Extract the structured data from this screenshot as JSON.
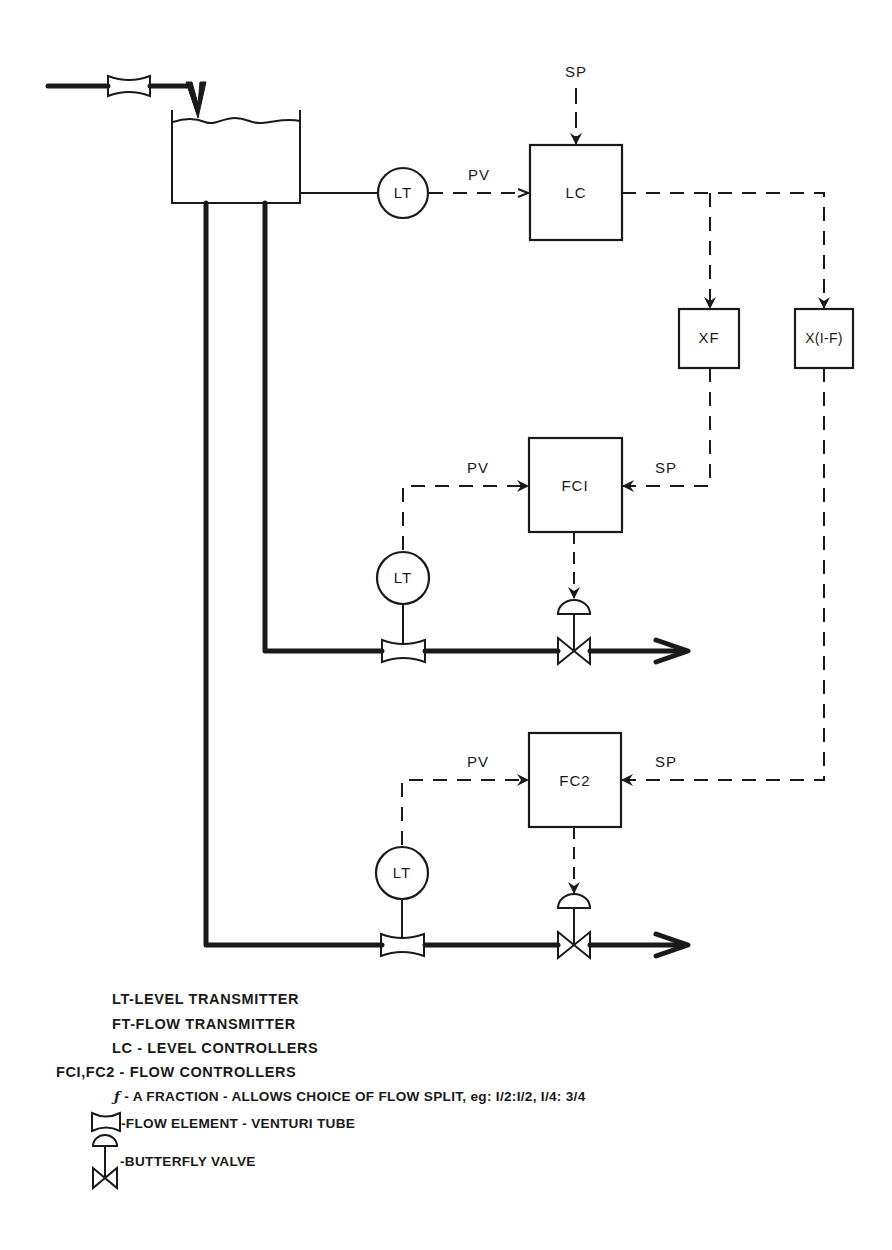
{
  "diagram": {
    "type": "process-control-schematic",
    "colors": {
      "ink": "#1a1a1a",
      "paper": "#ffffff"
    },
    "nodes": {
      "tank": {
        "label": ""
      },
      "lt_top": {
        "label": "LT"
      },
      "lc": {
        "label": "LC"
      },
      "xf": {
        "label": "XF"
      },
      "x1f": {
        "label": "X(I-F)"
      },
      "fc1": {
        "label": "FCI"
      },
      "fc2": {
        "label": "FC2"
      },
      "lt_mid": {
        "label": "LT"
      },
      "lt_bottom": {
        "label": "LT"
      }
    },
    "signals": {
      "lc_sp": "SP",
      "lc_pv": "PV",
      "fc1_pv": "PV",
      "fc1_sp": "SP",
      "fc2_pv": "PV",
      "fc2_sp": "SP"
    },
    "edges": [
      {
        "from": "inlet",
        "to": "tank",
        "kind": "pipe"
      },
      {
        "from": "tank",
        "to": "lt_top",
        "kind": "connection"
      },
      {
        "from": "lt_top",
        "to": "lc",
        "kind": "signal",
        "label": "PV"
      },
      {
        "from": "setpoint",
        "to": "lc",
        "kind": "signal",
        "label": "SP"
      },
      {
        "from": "lc",
        "to": "xf",
        "kind": "signal"
      },
      {
        "from": "lc",
        "to": "x1f",
        "kind": "signal"
      },
      {
        "from": "xf",
        "to": "fc1",
        "kind": "signal",
        "label": "SP"
      },
      {
        "from": "x1f",
        "to": "fc2",
        "kind": "signal",
        "label": "SP"
      },
      {
        "from": "lt_mid",
        "to": "fc1",
        "kind": "signal",
        "label": "PV"
      },
      {
        "from": "lt_bottom",
        "to": "fc2",
        "kind": "signal",
        "label": "PV"
      },
      {
        "from": "fc1",
        "to": "valve1",
        "kind": "signal"
      },
      {
        "from": "fc2",
        "to": "valve2",
        "kind": "signal"
      },
      {
        "from": "tank",
        "to": "outlet1",
        "kind": "pipe"
      },
      {
        "from": "tank",
        "to": "outlet2",
        "kind": "pipe"
      }
    ]
  },
  "legend": {
    "items": [
      {
        "key": "LT",
        "sep": "-",
        "text": "LEVEL TRANSMITTER"
      },
      {
        "key": "FT",
        "sep": "-",
        "text": "FLOW TRANSMITTER"
      },
      {
        "key": "LC",
        "sep": " - ",
        "text": "LEVEL CONTROLLERS"
      },
      {
        "key": "FCI,FC2",
        "sep": " - ",
        "text": "FLOW CONTROLLERS"
      },
      {
        "key": "ƒ",
        "sep": " - ",
        "text": "A FRACTION - ALLOWS CHOICE OF FLOW SPLIT, eg: I/2:I/2, I/4: 3/4"
      },
      {
        "key": "venturi-symbol",
        "sep": "-",
        "text": "FLOW ELEMENT - VENTURI TUBE"
      },
      {
        "key": "valve-symbol",
        "sep": "-",
        "text": "BUTTERFLY VALVE"
      }
    ]
  }
}
